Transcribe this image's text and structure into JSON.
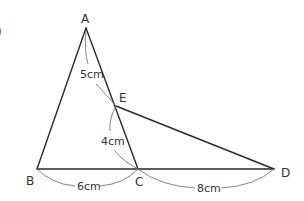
{
  "figure": {
    "partial_glyph": ")",
    "points": {
      "A": {
        "label": "A",
        "x": 86,
        "y": 28
      },
      "B": {
        "label": "B",
        "x": 37,
        "y": 169
      },
      "C": {
        "label": "C",
        "x": 138,
        "y": 169
      },
      "D": {
        "label": "D",
        "x": 274,
        "y": 169
      },
      "E": {
        "label": "E",
        "x": 116,
        "y": 106
      }
    },
    "segments": [
      {
        "from": "A",
        "to": "B"
      },
      {
        "from": "A",
        "to": "C"
      },
      {
        "from": "B",
        "to": "D"
      },
      {
        "from": "E",
        "to": "D"
      }
    ],
    "lengths": {
      "AE": "5cm",
      "EC": "4cm",
      "BC": "6cm",
      "CD": "8cm"
    },
    "colors": {
      "line": "#2a2a2a",
      "arc": "#777777",
      "text": "#333333"
    }
  }
}
